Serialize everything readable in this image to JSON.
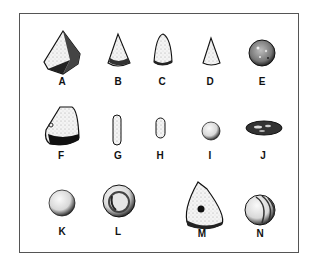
{
  "figure": {
    "items": [
      {
        "label": "A",
        "shape": "large-pyramidal-stone"
      },
      {
        "label": "B",
        "shape": "small-cone"
      },
      {
        "label": "C",
        "shape": "rounded-cone"
      },
      {
        "label": "D",
        "shape": "small-cone"
      },
      {
        "label": "E",
        "shape": "textured-sphere"
      },
      {
        "label": "F",
        "shape": "truncated-cone-dark-base"
      },
      {
        "label": "G",
        "shape": "elongated-rod"
      },
      {
        "label": "H",
        "shape": "short-rod"
      },
      {
        "label": "I",
        "shape": "small-sphere"
      },
      {
        "label": "J",
        "shape": "flat-disc-dark"
      },
      {
        "label": "K",
        "shape": "sphere"
      },
      {
        "label": "L",
        "shape": "ring-disc"
      },
      {
        "label": "M",
        "shape": "perforated-triangular-stone"
      },
      {
        "label": "N",
        "shape": "grooved-sphere"
      }
    ]
  }
}
